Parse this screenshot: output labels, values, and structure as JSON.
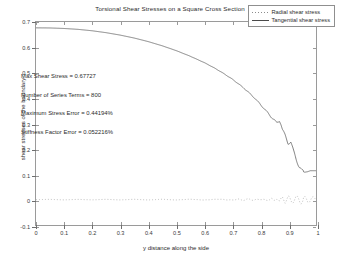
{
  "chart_data": {
    "type": "line",
    "title": "Torsional Shear Stresses on a Square Cross Section",
    "xlabel": "y distance along the side",
    "ylabel": "shear stresses of the boundary",
    "xlim": [
      0,
      1
    ],
    "ylim": [
      -0.1,
      0.7
    ],
    "xticks": [
      "0",
      "0.1",
      "0.2",
      "0.3",
      "0.4",
      "0.5",
      "0.6",
      "0.7",
      "0.8",
      "0.9",
      "1"
    ],
    "xtick_values": [
      0,
      0.1,
      0.2,
      0.3,
      0.4,
      0.5,
      0.6,
      0.7,
      0.8,
      0.9,
      1
    ],
    "yticks": [
      "-0.1",
      "0",
      "0.1",
      "0.2",
      "0.3",
      "0.4",
      "0.5",
      "0.6",
      "0.7"
    ],
    "ytick_values": [
      -0.1,
      0,
      0.1,
      0.2,
      0.3,
      0.4,
      0.5,
      0.6,
      0.7
    ],
    "grid": false,
    "legend_position": "upper-right",
    "legend": [
      "Radial shear stress",
      "Tangential shear stress"
    ],
    "series": [
      {
        "name": "Radial shear stress",
        "style": "dotted",
        "color": "#a0a0a0",
        "x": [
          0,
          0.05,
          0.1,
          0.15,
          0.2,
          0.25,
          0.3,
          0.35,
          0.4,
          0.45,
          0.5,
          0.55,
          0.6,
          0.65,
          0.7,
          0.72,
          0.74,
          0.76,
          0.78,
          0.8,
          0.82,
          0.84,
          0.85,
          0.86,
          0.87,
          0.88,
          0.89,
          0.9,
          0.905,
          0.91,
          0.915,
          0.92,
          0.925,
          0.93,
          0.935,
          0.94,
          0.945,
          0.95,
          0.955,
          0.96,
          0.965,
          0.97,
          0.975,
          0.98,
          0.985,
          0.99,
          1
        ],
        "values": [
          0,
          0.001,
          -0.001,
          0.001,
          -0.001,
          0.0012,
          -0.0012,
          0.0013,
          -0.0013,
          0.0014,
          -0.0014,
          0.0016,
          -0.0016,
          0.0018,
          -0.002,
          0.0022,
          -0.0024,
          0.0026,
          -0.0028,
          0.003,
          -0.0035,
          0.004,
          -0.005,
          0.006,
          -0.007,
          0.008,
          -0.009,
          0.011,
          0.006,
          -0.006,
          -0.011,
          -0.004,
          0.008,
          0.012,
          0.004,
          -0.008,
          -0.013,
          -0.005,
          0.008,
          0.013,
          0.005,
          -0.009,
          -0.013,
          -0.004,
          0.009,
          0.012,
          0
        ]
      },
      {
        "name": "Tangential shear stress",
        "style": "solid",
        "color": "#4a4a4a",
        "x": [
          0,
          0.05,
          0.1,
          0.15,
          0.2,
          0.25,
          0.3,
          0.35,
          0.4,
          0.45,
          0.5,
          0.55,
          0.6,
          0.62,
          0.64,
          0.66,
          0.68,
          0.7,
          0.72,
          0.74,
          0.76,
          0.78,
          0.8,
          0.82,
          0.84,
          0.85,
          0.86,
          0.87,
          0.875,
          0.88,
          0.89,
          0.9,
          0.91,
          0.92,
          0.93,
          0.94,
          0.95,
          0.96,
          0.97,
          0.98
        ],
        "values": [
          0.677,
          0.6765,
          0.6745,
          0.671,
          0.6655,
          0.658,
          0.6485,
          0.637,
          0.623,
          0.6065,
          0.5875,
          0.5655,
          0.5405,
          0.529,
          0.517,
          0.504,
          0.49,
          0.4755,
          0.459,
          0.4415,
          0.422,
          0.401,
          0.377,
          0.352,
          0.326,
          0.315,
          0.302,
          0.311,
          0.298,
          0.277,
          0.252,
          0.222,
          0.228,
          0.19,
          0.158,
          0.13,
          0.112,
          0.108,
          0.11,
          0.114
        ]
      }
    ],
    "annotations": [
      "Max Shear Stress = 0.67727",
      "Number of Series Terms = 800",
      "Maximum Stress Error = 0.44194%",
      "Stiffness Factor Error = 0.052216%"
    ],
    "max_shear_stress": 0.67727,
    "number_of_series_terms": 800,
    "maximum_stress_error_percent": 0.44194,
    "stiffness_factor_error_percent": 0.052216
  }
}
